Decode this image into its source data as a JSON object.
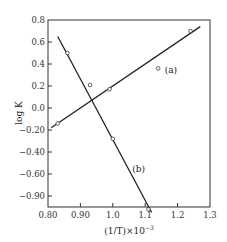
{
  "chart_data": {
    "type": "scatter",
    "title": "",
    "xlabel": "(1/T)×10⁻³",
    "ylabel": "log K",
    "xlim": [
      0.8,
      1.3
    ],
    "ylim": [
      -0.97,
      0.8
    ],
    "grid": false,
    "legend": "inline labels",
    "x_ticks": [
      0.8,
      0.9,
      1.0,
      1.1,
      1.2,
      1.3
    ],
    "x_tick_labels": [
      "0.80",
      "0.90",
      "1.0",
      "1.1",
      "1.2",
      "1.3"
    ],
    "y_ticks": [
      0.8,
      0.6,
      0.4,
      0.2,
      0.0,
      -0.2,
      -0.4,
      -0.6,
      -0.8
    ],
    "y_tick_labels": [
      "0.8",
      "0.6",
      "0.4",
      "0.2",
      "0.0",
      "−0.20",
      "−0.40",
      "−0.60",
      "−0.90"
    ],
    "series": [
      {
        "name": "(a)",
        "points": [
          {
            "x": 0.83,
            "y": -0.14
          },
          {
            "x": 0.99,
            "y": 0.17
          },
          {
            "x": 1.14,
            "y": 0.36
          },
          {
            "x": 1.24,
            "y": 0.7
          }
        ],
        "fit_line": [
          {
            "x": 0.81,
            "y": -0.18
          },
          {
            "x": 1.27,
            "y": 0.74
          }
        ]
      },
      {
        "name": "(b)",
        "points": [
          {
            "x": 0.86,
            "y": 0.5
          },
          {
            "x": 0.93,
            "y": 0.21
          },
          {
            "x": 1.0,
            "y": -0.28
          },
          {
            "x": 1.11,
            "y": -0.92
          }
        ],
        "fit_line": [
          {
            "x": 0.83,
            "y": 0.65
          },
          {
            "x": 1.12,
            "y": -0.95
          }
        ]
      }
    ],
    "annotations": [
      {
        "text": "(a)",
        "x": 1.16,
        "y": 0.32
      },
      {
        "text": "(b)",
        "x": 1.06,
        "y": -0.58
      }
    ]
  },
  "labels": {
    "xlabel": "(1/T)×10",
    "xlabel_exp": "−3",
    "ylabel": "log K",
    "series_a": "(a)",
    "series_b": "(b)"
  }
}
